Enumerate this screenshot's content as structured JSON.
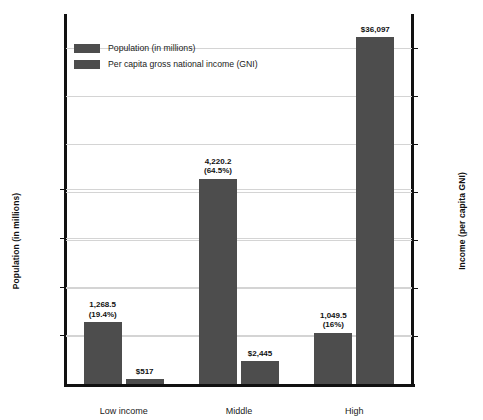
{
  "chart_data": {
    "type": "bar",
    "title": "",
    "xlabel": "",
    "categories": [
      "Low income",
      "Middle",
      "High"
    ],
    "grid": true,
    "legend_position": "top-left-inside",
    "series": [
      {
        "name": "Population (in millions)",
        "axis": "left",
        "values": [
          1268.5,
          4220.2,
          1049.5
        ],
        "labels": [
          "1,268.5",
          "4,220.2",
          "1,049.5"
        ],
        "sublabels": [
          "(19.4%)",
          "(64.5%)",
          "(16%)"
        ],
        "color": "#4d4d4d"
      },
      {
        "name": "Per capita gross national income (GNI)",
        "axis": "right",
        "values": [
          517,
          2445,
          36097
        ],
        "labels": [
          "$517",
          "$2,445",
          "$36,097"
        ],
        "sublabels": [
          "",
          "",
          ""
        ],
        "color": "#4d4d4d"
      }
    ],
    "left_axis": {
      "label": "Population (in millions)",
      "ticks": [
        1000,
        2000,
        3000,
        4000
      ],
      "tick_labels": [
        "1,000",
        "2,000",
        "3,000",
        "4,000"
      ],
      "ylim": [
        0,
        7600
      ]
    },
    "right_axis": {
      "label": "Income (per capita GNI)",
      "ticks": [
        5000,
        10000,
        15000,
        20000,
        25000,
        30000,
        35000
      ],
      "tick_labels": [
        "5,000",
        "10,000",
        "15,000",
        "20,000",
        "25,000",
        "30,000",
        "35,000"
      ],
      "ylim": [
        0,
        38500
      ]
    }
  }
}
